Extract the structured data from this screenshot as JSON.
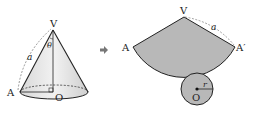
{
  "cone": {
    "apex_label": "V",
    "base_point_label": "A",
    "center_label": "O",
    "slant_label": "a",
    "angle_label": "θ"
  },
  "arrow": {
    "direction": "right"
  },
  "net": {
    "apex_label": "V",
    "left_label": "A",
    "right_label": "A′",
    "slant_label": "a",
    "center_label": "O",
    "radius_label": "r"
  },
  "colors": {
    "sector_fill": "#b8b8b8",
    "cone_fill": "#e6e6e6",
    "stroke": "#222222",
    "arrow": "#777777"
  }
}
